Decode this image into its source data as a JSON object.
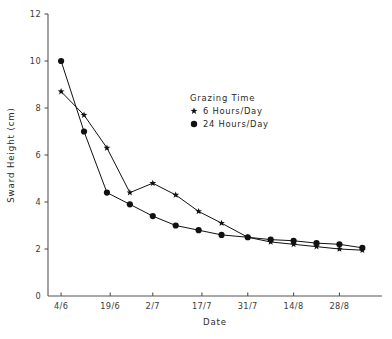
{
  "chart_data": {
    "type": "line",
    "title": "",
    "xlabel": "Date",
    "ylabel": "Sward Height (cm)",
    "ylim": [
      0,
      12
    ],
    "yticks": [
      0,
      2,
      4,
      6,
      8,
      10,
      12
    ],
    "ytick_labels": [
      "0",
      "2",
      "4",
      "6",
      "8",
      "10",
      "12"
    ],
    "xtick_labels": [
      "4/6",
      "19/6",
      "2/7",
      "17/7",
      "31/7",
      "14/8",
      "28/8"
    ],
    "xtick_days": [
      0,
      15,
      28,
      43,
      57,
      71,
      85
    ],
    "xlim_days": [
      -4,
      98
    ],
    "grid": false,
    "legend_position": "upper-center",
    "legend_title": "Grazing Time",
    "series": [
      {
        "name": "6 Hours/Day",
        "marker": "star",
        "x_days": [
          0,
          7,
          14,
          21,
          28,
          35,
          42,
          49,
          57,
          64,
          71,
          78,
          85,
          92
        ],
        "x_labels": [
          "4/6",
          "11/6",
          "18/6",
          "25/6",
          "2/7",
          "9/7",
          "16/7",
          "23/7",
          "31/7",
          "7/8",
          "14/8",
          "21/8",
          "28/8",
          "4/9"
        ],
        "values": [
          8.7,
          7.7,
          6.3,
          4.4,
          4.8,
          4.3,
          3.6,
          3.1,
          2.5,
          2.3,
          2.2,
          2.1,
          2.0,
          1.95
        ]
      },
      {
        "name": "24 Hours/Day",
        "marker": "circle",
        "x_days": [
          0,
          7,
          14,
          21,
          28,
          35,
          42,
          49,
          57,
          64,
          71,
          78,
          85,
          92
        ],
        "x_labels": [
          "4/6",
          "11/6",
          "18/6",
          "25/6",
          "2/7",
          "9/7",
          "16/7",
          "23/7",
          "31/7",
          "7/8",
          "14/8",
          "21/8",
          "28/8",
          "4/9"
        ],
        "values": [
          10.0,
          7.0,
          4.4,
          3.9,
          3.4,
          3.0,
          2.8,
          2.6,
          2.5,
          2.4,
          2.35,
          2.25,
          2.2,
          2.05
        ]
      }
    ]
  },
  "legend": {
    "title": "Grazing Time",
    "entries": [
      {
        "marker": "star-marker",
        "label": "6 Hours/Day"
      },
      {
        "marker": "circle-marker",
        "label": "24 Hours/Day"
      }
    ]
  },
  "axes": {
    "y_title": "Sward Height (cm)",
    "x_title": "Date"
  },
  "caption": {
    "text": ""
  }
}
